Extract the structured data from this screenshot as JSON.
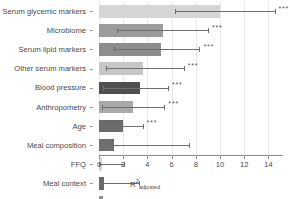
{
  "chart_data": {
    "type": "bar",
    "orientation": "horizontal",
    "title": "",
    "xlabel": "R2adjusted",
    "xlabel_base": "R",
    "xlabel_sup": "2",
    "xlabel_sub": "adjusted",
    "ylabel": "",
    "xlim": [
      0,
      15.2
    ],
    "xticks": [
      0,
      2,
      4,
      6,
      8,
      10,
      12,
      14
    ],
    "xticklabels": [
      "0",
      "2",
      "4",
      "6",
      "8",
      "10",
      "12",
      "14"
    ],
    "grid": true,
    "grid_axis": "x",
    "legend": "none",
    "categories": [
      "Serum glycemic markers",
      "Microbiome",
      "Serum lipid markers",
      "Other serum markers",
      "Blood pressure",
      "Anthropometry",
      "Age",
      "Meal composition",
      "FFQ",
      "Meal context",
      "Genetics",
      "Sex"
    ],
    "values": [
      10.0,
      5.3,
      5.1,
      3.6,
      3.4,
      2.8,
      2.0,
      1.2,
      0.25,
      0.45,
      0.35,
      0.1
    ],
    "error_high": [
      14.5,
      9.0,
      8.3,
      7.0,
      5.7,
      5.4,
      3.6,
      7.4,
      2.1,
      3.3,
      2.0,
      1.0
    ],
    "error_low": [
      6.3,
      1.5,
      1.2,
      0.6,
      0.35,
      0.25,
      0.0,
      0.0,
      0.0,
      0.0,
      0.0,
      0.0
    ],
    "significance": [
      "***",
      "***",
      "***",
      "***",
      "***",
      "***",
      "***",
      "",
      "",
      "",
      "",
      ""
    ],
    "bar_colors": [
      "#d6d6d6",
      "#9c9c9c",
      "#8d8d8d",
      "#c7c7c7",
      "#4f4f4f",
      "#a8a8a8",
      "#6b6b6b",
      "#6f6f6f",
      "#d2d2d2",
      "#6a6a6a",
      "#909090",
      "#9a9a9a"
    ],
    "error_color": "#6e6e6e",
    "grid_color": "#e8e8e8",
    "axis_color": "#8c8c8c",
    "text_color": "#4a4a4a",
    "background_color": "#ffffff"
  }
}
